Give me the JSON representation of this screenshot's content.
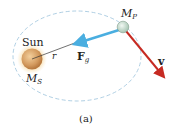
{
  "diagram": {
    "sun_label": "Sun",
    "sun_mass_label": "M",
    "sun_mass_sub": "S",
    "planet_mass_label": "M",
    "planet_mass_sub": "P",
    "radius_label": "r",
    "force_label": "F",
    "force_sub": "g",
    "velocity_label": "v",
    "caption": "(a)"
  },
  "colors": {
    "orbit": "#9cc3dc",
    "sun_fill": "#d9a26a",
    "sun_glow": "#f5d9a0",
    "planet_fill": "#cfe3d6",
    "force_arrow": "#4aaee0",
    "velocity_arrow": "#c62a22",
    "radius_line": "#333333"
  }
}
